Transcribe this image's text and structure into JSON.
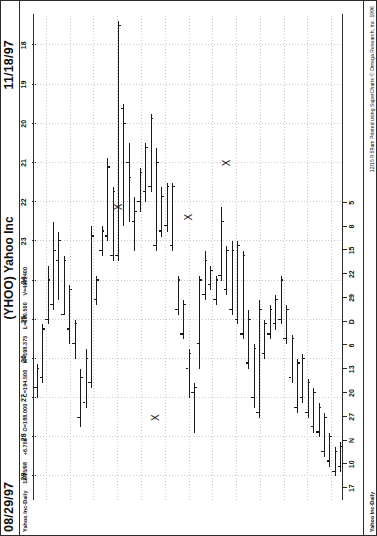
{
  "header": {
    "date_left": "08/29/97",
    "date_right": "11/18/97",
    "title": "(YHOO) Yahoo Inc"
  },
  "quote_line": {
    "symbol_desc": "Yahoo Inc-Daily",
    "quote_date": "12/15/98",
    "change": "+6.750",
    "open_label": "O=188.000",
    "close_label": "C=194.500",
    "high_label": "H=198.375",
    "low_label": "L=180.500",
    "volume_label": "V=4082400"
  },
  "credit": "12/15  9:59am Printed using SuperCharts © Omega Research, Inc. 1996",
  "chart_data": {
    "type": "bar",
    "subtype": "ohlc-bar",
    "title": "(YHOO) Yahoo Inc",
    "xlabel": "",
    "ylabel": "",
    "grid": true,
    "legend": "none",
    "ylim": [
      17.2,
      29.6
    ],
    "yticks": [
      29,
      28,
      27,
      26,
      25,
      24,
      23,
      22,
      21,
      20,
      19,
      18
    ],
    "xticks": [
      "17",
      "10",
      "N",
      "27",
      "20",
      "13",
      "6",
      "D",
      "29",
      "22",
      "15",
      "8",
      "5"
    ],
    "x_start": "08/29/97",
    "x_end": "11/18/97",
    "bars": [
      {
        "i": 0,
        "open": 26.75,
        "high": 27.0,
        "low": 26.12,
        "close": 26.25
      },
      {
        "i": 1,
        "open": 26.5,
        "high": 26.62,
        "low": 25.12,
        "close": 25.25
      },
      {
        "i": 2,
        "open": 25.0,
        "high": 25.12,
        "low": 23.62,
        "close": 24.0
      },
      {
        "i": 3,
        "open": 24.62,
        "high": 24.75,
        "low": 22.5,
        "close": 23.25
      },
      {
        "i": 4,
        "open": 23.5,
        "high": 24.5,
        "low": 22.75,
        "close": 23.0
      },
      {
        "i": 5,
        "open": 24.88,
        "high": 24.88,
        "low": 23.38,
        "close": 23.5
      },
      {
        "i": 6,
        "open": 25.25,
        "high": 25.62,
        "low": 24.12,
        "close": 24.25
      },
      {
        "i": 7,
        "open": 25.62,
        "high": 26.0,
        "low": 25.0,
        "close": 25.12
      },
      {
        "i": 8,
        "open": 27.5,
        "high": 27.75,
        "low": 26.25,
        "close": 26.5
      },
      {
        "i": 9,
        "open": 27.12,
        "high": 27.25,
        "low": 25.75,
        "close": 26.0
      },
      {
        "i": 10,
        "open": 26.62,
        "high": 26.75,
        "low": 22.62,
        "close": 22.88
      },
      {
        "i": 11,
        "open": 24.5,
        "high": 24.62,
        "low": 23.88,
        "close": 24.0
      },
      {
        "i": 12,
        "open": 23.25,
        "high": 23.38,
        "low": 22.62,
        "close": 22.75
      },
      {
        "i": 13,
        "open": 22.88,
        "high": 23.0,
        "low": 20.88,
        "close": 21.12
      },
      {
        "i": 14,
        "open": 23.38,
        "high": 23.5,
        "low": 21.62,
        "close": 21.75
      },
      {
        "i": 15,
        "open": 23.38,
        "high": 23.5,
        "low": 17.38,
        "close": 17.5
      },
      {
        "i": 16,
        "open": 19.62,
        "high": 22.62,
        "low": 19.5,
        "close": 20.0
      },
      {
        "i": 17,
        "open": 21.0,
        "high": 22.5,
        "low": 20.5,
        "close": 21.38
      },
      {
        "i": 18,
        "open": 22.5,
        "high": 23.25,
        "low": 21.88,
        "close": 22.25
      },
      {
        "i": 19,
        "open": 22.0,
        "high": 22.25,
        "low": 21.12,
        "close": 21.25
      },
      {
        "i": 20,
        "open": 21.75,
        "high": 22.0,
        "low": 20.5,
        "close": 20.62
      },
      {
        "i": 21,
        "open": 21.62,
        "high": 21.75,
        "low": 19.75,
        "close": 19.88
      },
      {
        "i": 22,
        "open": 23.12,
        "high": 23.25,
        "low": 20.62,
        "close": 21.0
      },
      {
        "i": 23,
        "open": 22.75,
        "high": 22.88,
        "low": 21.62,
        "close": 21.88
      },
      {
        "i": 24,
        "open": 22.62,
        "high": 22.75,
        "low": 21.5,
        "close": 21.62
      },
      {
        "i": 25,
        "open": 23.12,
        "high": 23.25,
        "low": 21.5,
        "close": 21.62
      },
      {
        "i": 26,
        "open": 24.75,
        "high": 24.88,
        "low": 23.88,
        "close": 24.0
      },
      {
        "i": 27,
        "open": 25.38,
        "high": 25.5,
        "low": 24.5,
        "close": 24.62
      },
      {
        "i": 28,
        "open": 26.25,
        "high": 27.0,
        "low": 25.75,
        "close": 25.88
      },
      {
        "i": 29,
        "open": 26.88,
        "high": 27.88,
        "low": 26.62,
        "close": 26.75
      },
      {
        "i": 30,
        "open": 25.62,
        "high": 26.25,
        "low": 23.88,
        "close": 24.0
      },
      {
        "i": 31,
        "open": 24.38,
        "high": 24.5,
        "low": 23.25,
        "close": 23.5
      },
      {
        "i": 32,
        "open": 24.12,
        "high": 24.25,
        "low": 23.62,
        "close": 23.75
      },
      {
        "i": 33,
        "open": 24.5,
        "high": 24.62,
        "low": 23.88,
        "close": 24.0
      },
      {
        "i": 34,
        "open": 23.88,
        "high": 24.0,
        "low": 22.12,
        "close": 22.5
      },
      {
        "i": 35,
        "open": 24.25,
        "high": 24.38,
        "low": 23.12,
        "close": 23.25
      },
      {
        "i": 36,
        "open": 24.75,
        "high": 24.88,
        "low": 23.0,
        "close": 23.25
      },
      {
        "i": 37,
        "open": 25.0,
        "high": 25.12,
        "low": 23.0,
        "close": 23.12
      },
      {
        "i": 38,
        "open": 25.38,
        "high": 25.5,
        "low": 23.25,
        "close": 23.38
      },
      {
        "i": 39,
        "open": 26.12,
        "high": 26.25,
        "low": 24.75,
        "close": 25.0
      },
      {
        "i": 40,
        "open": 27.0,
        "high": 27.25,
        "low": 25.62,
        "close": 25.75
      },
      {
        "i": 41,
        "open": 27.38,
        "high": 27.5,
        "low": 24.5,
        "close": 24.75
      },
      {
        "i": 42,
        "open": 25.88,
        "high": 26.0,
        "low": 25.0,
        "close": 25.12
      },
      {
        "i": 43,
        "open": 25.38,
        "high": 25.5,
        "low": 24.62,
        "close": 24.75
      },
      {
        "i": 44,
        "open": 25.12,
        "high": 25.25,
        "low": 24.38,
        "close": 24.5
      },
      {
        "i": 45,
        "open": 25.0,
        "high": 25.12,
        "low": 23.88,
        "close": 24.0
      },
      {
        "i": 46,
        "open": 25.5,
        "high": 25.62,
        "low": 24.62,
        "close": 24.75
      },
      {
        "i": 47,
        "open": 26.5,
        "high": 26.62,
        "low": 25.38,
        "close": 25.5
      },
      {
        "i": 48,
        "open": 27.25,
        "high": 27.38,
        "low": 26.0,
        "close": 26.12
      },
      {
        "i": 49,
        "open": 27.0,
        "high": 27.12,
        "low": 25.88,
        "close": 26.0
      },
      {
        "i": 50,
        "open": 27.38,
        "high": 27.5,
        "low": 26.5,
        "close": 26.62
      },
      {
        "i": 51,
        "open": 27.75,
        "high": 27.88,
        "low": 26.75,
        "close": 26.88
      },
      {
        "i": 52,
        "open": 27.88,
        "high": 28.0,
        "low": 27.12,
        "close": 27.25
      },
      {
        "i": 53,
        "open": 28.38,
        "high": 28.5,
        "low": 27.38,
        "close": 27.5
      },
      {
        "i": 54,
        "open": 28.62,
        "high": 28.75,
        "low": 27.88,
        "close": 28.0
      },
      {
        "i": 55,
        "open": 28.88,
        "high": 29.0,
        "low": 28.25,
        "close": 28.38
      },
      {
        "i": 56,
        "open": 28.75,
        "high": 28.88,
        "low": 28.12,
        "close": 28.25
      }
    ],
    "markers": [
      {
        "label": "X",
        "bar_index": 15,
        "price": 22.12
      },
      {
        "label": "X",
        "bar_index": 22,
        "price": 27.5
      },
      {
        "label": "X",
        "bar_index": 28,
        "price": 22.38
      },
      {
        "label": "X",
        "bar_index": 35,
        "price": 21.0
      }
    ]
  }
}
